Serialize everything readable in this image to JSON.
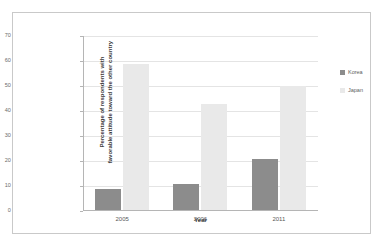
{
  "chart_data": {
    "type": "bar",
    "title": "",
    "subtitle": "",
    "categories": [
      "2005",
      "2006",
      "2011"
    ],
    "series": [
      {
        "name": "Korea",
        "values": [
          9,
          11,
          21
        ],
        "color": "#8c8c8c"
      },
      {
        "name": "Japan",
        "values": [
          59,
          43,
          50
        ],
        "color": "#e9e9e9"
      }
    ],
    "xlabel": "Year",
    "ylabel": "Percentage of respondents with favorable attitude toward the other country",
    "ylim": [
      0,
      70
    ],
    "ytick_step": 10,
    "yticks": [
      "70",
      "60",
      "50",
      "40",
      "30",
      "20",
      "10",
      "0"
    ],
    "grid": true,
    "legend_position": "right",
    "background_color": "#ffffff",
    "frame_color": "#c9c9c9",
    "axis_color": "#b5b5b5",
    "gridline_color": "#e4e4e4"
  },
  "axes": {
    "x_title": "Year",
    "y_title_line1": "Percentage of respondents with",
    "y_title_line2": "favorable attitude toward the other country"
  },
  "legend": {
    "items": [
      {
        "label": "Korea",
        "swatch": "korea"
      },
      {
        "label": "Japan",
        "swatch": "japan"
      }
    ]
  }
}
